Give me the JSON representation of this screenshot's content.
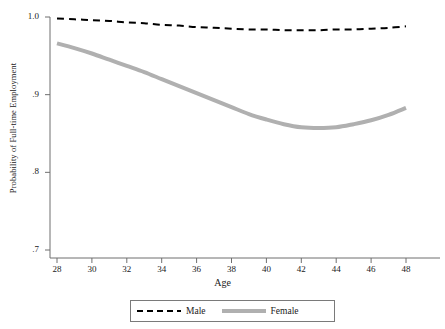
{
  "chart_data": {
    "type": "line",
    "title": "",
    "xlabel": "Age",
    "ylabel": "Probability of Full-time Employment",
    "xlim": [
      28,
      48
    ],
    "ylim": [
      0.7,
      1.0
    ],
    "xticks": [
      28,
      30,
      32,
      34,
      36,
      38,
      40,
      42,
      44,
      46,
      48
    ],
    "xtick_labels": [
      "28",
      "30",
      "32",
      "34",
      "36",
      "38",
      "40",
      "42",
      "44",
      "46",
      "48"
    ],
    "yticks": [
      0.7,
      0.8,
      0.9,
      1.0
    ],
    "ytick_labels": [
      ".7",
      ".8",
      ".9",
      "1.0"
    ],
    "grid": false,
    "legend_position": "bottom",
    "x": [
      28,
      29,
      30,
      31,
      32,
      33,
      34,
      35,
      36,
      37,
      38,
      39,
      40,
      41,
      42,
      43,
      44,
      45,
      46,
      47,
      48
    ],
    "series": [
      {
        "name": "Male",
        "style": "dashed",
        "color": "#000000",
        "width": 2,
        "values": [
          0.998,
          0.997,
          0.996,
          0.995,
          0.993,
          0.992,
          0.99,
          0.989,
          0.987,
          0.986,
          0.985,
          0.984,
          0.984,
          0.983,
          0.983,
          0.983,
          0.984,
          0.984,
          0.985,
          0.986,
          0.988
        ]
      },
      {
        "name": "Female",
        "style": "solid",
        "color": "#b0b0b0",
        "width": 4,
        "values": [
          0.966,
          0.96,
          0.953,
          0.945,
          0.937,
          0.929,
          0.92,
          0.911,
          0.902,
          0.893,
          0.884,
          0.875,
          0.868,
          0.862,
          0.858,
          0.857,
          0.858,
          0.862,
          0.867,
          0.874,
          0.883
        ]
      }
    ],
    "legend": [
      {
        "label": "Male",
        "style": "dashed",
        "color": "#000000"
      },
      {
        "label": "Female",
        "style": "solid",
        "color": "#b0b0b0"
      }
    ],
    "axis_color": "#6f6f6f"
  }
}
